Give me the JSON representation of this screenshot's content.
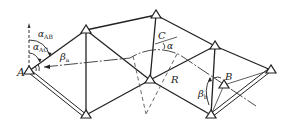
{
  "diagram": {
    "colors": {
      "line": "#222222",
      "background": "#ffffff",
      "dashed": "#555555"
    },
    "labels": {
      "A": "A",
      "B": "B",
      "C": "C",
      "R": "R",
      "alpha": "α",
      "alpha_AB_main": "α",
      "alpha_AB_sub": "AB",
      "alpha_AC_main": "α",
      "alpha_AC_sub": "AC",
      "beta_a_main": "β",
      "beta_a_sub": "a",
      "beta_b_main": "β",
      "beta_b_sub": "b"
    },
    "stations": [
      {
        "id": "A",
        "x": 29,
        "y": 71
      },
      {
        "id": "T1",
        "x": 86,
        "y": 30
      },
      {
        "id": "T2",
        "x": 86,
        "y": 115
      },
      {
        "id": "T3",
        "x": 156,
        "y": 15
      },
      {
        "id": "T4",
        "x": 150,
        "y": 80
      },
      {
        "id": "T5",
        "x": 215,
        "y": 46
      },
      {
        "id": "T6",
        "x": 211,
        "y": 115
      },
      {
        "id": "B",
        "x": 224,
        "y": 85
      },
      {
        "id": "T7",
        "x": 271,
        "y": 70
      }
    ]
  }
}
